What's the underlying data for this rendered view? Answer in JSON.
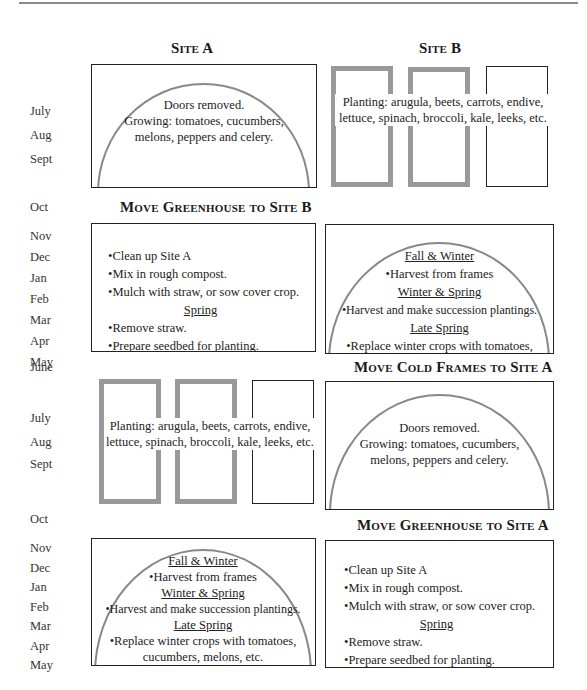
{
  "headings": {
    "site_a": "Site A",
    "site_b": "Site B",
    "move_gh_b": "Move Greenhouse to Site B",
    "move_cf_a": "Move Cold Frames to Site A",
    "move_gh_a": "Move Greenhouse to Site A"
  },
  "months": {
    "block1": [
      "July",
      "Aug",
      "Sept"
    ],
    "oct1": "Oct",
    "block2": [
      "Nov",
      "Dec",
      "Jan",
      "Feb",
      "Mar",
      "Apr",
      "May"
    ],
    "june": "June",
    "block3": [
      "July",
      "Aug",
      "Sept"
    ],
    "oct2": "Oct",
    "block4": [
      "Nov",
      "Dec",
      "Jan",
      "Feb",
      "Mar",
      "Apr",
      "May"
    ]
  },
  "greenhouse_summer": {
    "line1": "Doors removed.",
    "line2": "Growing: tomatoes, cucumbers,",
    "line3": "melons, peppers and celery."
  },
  "cold_frames_summer": {
    "line1": "Planting: arugula, beets, carrots, endive,",
    "line2": "lettuce, spinach, broccoli, kale, leeks, etc."
  },
  "site_cleanup": {
    "item1": "•Clean up Site A",
    "item2": "•Mix in rough compost.",
    "item3": "•Mulch with straw, or sow cover crop.",
    "spring_heading": "Spring",
    "item4": "•Remove straw.",
    "item5": "•Prepare seedbed for planting."
  },
  "greenhouse_winter": {
    "h1": "Fall & Winter",
    "l1": "•Harvest from frames",
    "h2": "Winter & Spring",
    "l2": "•Harvest and make succession plantings.",
    "h3": "Late Spring",
    "l3": "•Replace winter crops with tomatoes,",
    "l4": "cucumbers, melons, etc."
  }
}
